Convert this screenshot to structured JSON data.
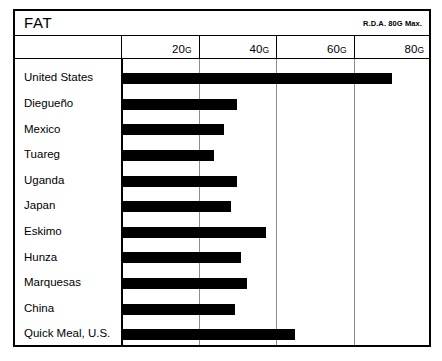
{
  "header": {
    "title": "FAT",
    "rda_note": "R.D.A. 80G Max."
  },
  "chart_data": {
    "type": "bar",
    "orientation": "horizontal",
    "title": "FAT",
    "annotation": "R.D.A. 80G Max.",
    "xlabel": "",
    "ylabel": "",
    "unit": "G",
    "xlim": [
      0,
      80
    ],
    "grid": true,
    "legend": false,
    "tick_labels": [
      "20G",
      "40G",
      "60G",
      "80G"
    ],
    "ticks": [
      20,
      40,
      60,
      80
    ],
    "categories": [
      "United States",
      "Diegueño",
      "Mexico",
      "Tuareg",
      "Uganda",
      "Japan",
      "Eskimo",
      "Hunza",
      "Marquesas",
      "China",
      "Quick Meal, U.S."
    ],
    "values": [
      70,
      30,
      26.5,
      24,
      30,
      28.5,
      37.5,
      31,
      32.5,
      29.5,
      45
    ],
    "bar_color": "#000000"
  }
}
